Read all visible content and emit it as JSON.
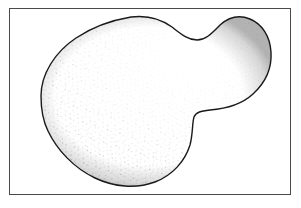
{
  "figure": {
    "title": "Irregular stippled blob outline",
    "caption": "",
    "medium": "line drawing with stipple shading",
    "background_color": "#ffffff",
    "frame": {
      "visible": true,
      "color": "#4a4a4a",
      "line_width": 1,
      "x": 9,
      "y": 8,
      "width": 282,
      "height": 187
    },
    "shape": {
      "name": "blob-outline",
      "description": "Closed irregular two-lobed amoeba-like contour with a concave notch on the right side",
      "outline_color": "#1a1a1a",
      "outline_width": 1.4,
      "fill_color": "#ffffff",
      "stipple_color": "#6e6e6e",
      "stipple_density": "sparse-to-moderate, heavier near the upper-right and along edges",
      "lobe_count": 2,
      "bounds": {
        "left": 40,
        "top": 16,
        "right": 271,
        "bottom": 186
      },
      "path": "M 41 96 C 41 74, 55 52, 76 38 C 94 26, 113 20, 131 17 C 147 15, 161 19, 172 27 C 181 34, 188 40, 197 40 C 206 40, 212 33, 220 25 C 229 17, 240 15, 250 19 C 262 24, 270 36, 271 52 C 272 68, 265 83, 253 94 C 241 105, 223 109, 210 110 C 201 111, 196 112, 194 117 C 192 124, 193 134, 190 145 C 185 161, 173 175, 155 182 C 136 189, 114 187, 95 178 C 74 168, 57 150, 48 131 C 42 119, 41 107, 41 96 Z",
      "notch": {
        "x": 196,
        "y": 113,
        "type": "concave-inflection"
      },
      "key_points": [
        {
          "name": "left-extreme",
          "x": 41,
          "y": 96
        },
        {
          "name": "upper-left-shoulder",
          "x": 88,
          "y": 32
        },
        {
          "name": "top-peak-left-lobe",
          "x": 137,
          "y": 17
        },
        {
          "name": "saddle-between-lobes",
          "x": 196,
          "y": 40
        },
        {
          "name": "top-peak-right-lobe",
          "x": 243,
          "y": 17
        },
        {
          "name": "right-extreme",
          "x": 271,
          "y": 55
        },
        {
          "name": "right-notch",
          "x": 196,
          "y": 113
        },
        {
          "name": "bottom-extreme",
          "x": 140,
          "y": 186
        },
        {
          "name": "lower-left",
          "x": 62,
          "y": 149
        }
      ]
    }
  }
}
